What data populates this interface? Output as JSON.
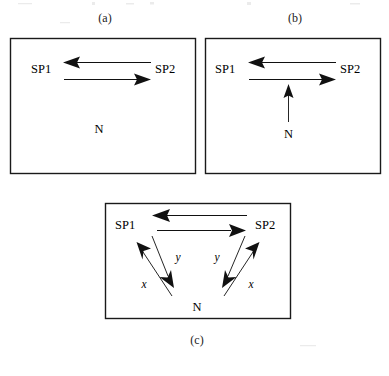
{
  "figure": {
    "caption_a": "(a)",
    "caption_b": "(b)",
    "caption_c": "(c)",
    "panels": [
      {
        "id": "a",
        "caption": "(a)",
        "nodes": [
          {
            "id": "sp1",
            "label": "SP1"
          },
          {
            "id": "sp2",
            "label": "SP2"
          },
          {
            "id": "n",
            "label": "N"
          }
        ],
        "edges": [
          {
            "from": "SP2",
            "to": "SP1",
            "label": "",
            "direction": "left"
          },
          {
            "from": "SP1",
            "to": "SP2",
            "label": "",
            "direction": "right"
          }
        ]
      },
      {
        "id": "b",
        "caption": "(b)",
        "nodes": [
          {
            "id": "sp1",
            "label": "SP1"
          },
          {
            "id": "sp2",
            "label": "SP2"
          },
          {
            "id": "n",
            "label": "N"
          }
        ],
        "edges": [
          {
            "from": "SP2",
            "to": "SP1",
            "label": "",
            "direction": "left"
          },
          {
            "from": "SP1",
            "to": "SP2",
            "label": "",
            "direction": "right"
          },
          {
            "from": "N",
            "to": "SP1-SP2 link",
            "label": "",
            "direction": "up"
          }
        ]
      },
      {
        "id": "c",
        "caption": "(c)",
        "nodes": [
          {
            "id": "sp1",
            "label": "SP1"
          },
          {
            "id": "sp2",
            "label": "SP2"
          },
          {
            "id": "n",
            "label": "N"
          }
        ],
        "edges": [
          {
            "from": "SP2",
            "to": "SP1",
            "label": "",
            "direction": "left"
          },
          {
            "from": "SP1",
            "to": "SP2",
            "label": "",
            "direction": "right"
          },
          {
            "from": "N",
            "to": "SP1",
            "label": "x",
            "direction": "up-left"
          },
          {
            "from": "SP1",
            "to": "N",
            "label": "y",
            "direction": "down-right"
          },
          {
            "from": "SP2",
            "to": "N",
            "label": "y",
            "direction": "down-left"
          },
          {
            "from": "N",
            "to": "SP2",
            "label": "x",
            "direction": "up-right"
          }
        ]
      }
    ],
    "labels": {
      "sp1": "SP1",
      "sp2": "SP2",
      "n": "N",
      "x": "x",
      "y": "y"
    },
    "colors": {
      "stroke": "#111111",
      "box": "#1a1a1a",
      "background": "#ffffff"
    }
  }
}
